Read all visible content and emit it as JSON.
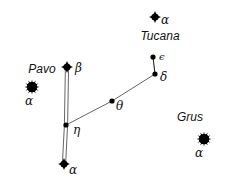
{
  "diagram": {
    "type": "star-chart",
    "constellations": [
      {
        "name": "Pavo",
        "label_pos": [
          42,
          73
        ]
      },
      {
        "name": "Tucana",
        "label_pos": [
          160,
          40
        ]
      },
      {
        "name": "Grus",
        "label_pos": [
          190,
          121
        ]
      }
    ],
    "stars": [
      {
        "id": "tuc-alpha",
        "constellation": "Tucana",
        "greek": "α",
        "style": "bright-4point",
        "pos": [
          155,
          17
        ],
        "label_pos": [
          161,
          24
        ]
      },
      {
        "id": "tuc-epsilon",
        "constellation": "Tucana",
        "greek": "ϵ",
        "style": "dot",
        "pos": [
          153,
          57
        ],
        "label_pos": [
          159,
          60
        ]
      },
      {
        "id": "tuc-delta",
        "constellation": "Tucana",
        "greek": "δ",
        "style": "dot",
        "pos": [
          155,
          74
        ],
        "label_pos": [
          160,
          81
        ]
      },
      {
        "id": "pav-theta",
        "constellation": "Pavo",
        "greek": "θ",
        "style": "dot",
        "pos": [
          112,
          101
        ],
        "label_pos": [
          116,
          110
        ]
      },
      {
        "id": "pav-beta",
        "constellation": "Pavo",
        "greek": "β",
        "style": "bright-4point",
        "pos": [
          67,
          67
        ],
        "label_pos": [
          75,
          72
        ]
      },
      {
        "id": "pav-alpha",
        "constellation": "Pavo",
        "greek": "α",
        "style": "bright-spiky",
        "pos": [
          32,
          87
        ],
        "label_pos": [
          25,
          105
        ]
      },
      {
        "id": "pav-eta",
        "constellation": "Pavo",
        "greek": "η",
        "style": "dot",
        "pos": [
          66,
          125
        ],
        "label_pos": [
          73,
          134
        ]
      },
      {
        "id": "tuc-alpha-lower",
        "constellation": "Tucana",
        "greek": "α",
        "style": "bright-4point",
        "pos": [
          64,
          164
        ],
        "label_pos": [
          69,
          174
        ]
      },
      {
        "id": "gru-alpha",
        "constellation": "Grus",
        "greek": "α",
        "style": "bright-spiky",
        "pos": [
          204,
          139
        ],
        "label_pos": [
          195,
          157
        ]
      }
    ],
    "lines": [
      {
        "from": "tuc-epsilon",
        "to": "tuc-delta",
        "style": "single-dark"
      },
      {
        "from": "tuc-delta",
        "to": "pav-theta",
        "style": "single-thin"
      },
      {
        "from": "pav-theta",
        "to": "pav-eta",
        "style": "single-thin"
      },
      {
        "from": "pav-beta",
        "to": "pav-eta",
        "style": "double"
      },
      {
        "from": "pav-eta",
        "to": "tuc-alpha-lower",
        "style": "double"
      }
    ],
    "colors": {
      "background": "#ffffff",
      "star": "#000000",
      "line": "#555555",
      "text": "#111111"
    }
  }
}
